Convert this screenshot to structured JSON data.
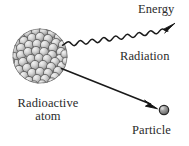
{
  "diagram": {
    "title_caption": "",
    "background_color": "#ffffff",
    "labels": {
      "energy": "Energy",
      "radiation": "Radiation",
      "particle": "Particle",
      "radioactive_atom_line1": "Radioactive",
      "radioactive_atom_line2": "atom"
    },
    "elements": {
      "nucleus": {
        "name": "radioactive-atom-nucleus",
        "shape": "cluster-of-spheres",
        "center_x": 40,
        "center_y": 56,
        "radius": 27,
        "sphere_fill": "#c9c9c9",
        "sphere_stroke": "#4a4a4a",
        "highlight": "#ebebeb",
        "sphere_count": 61
      },
      "radiation_wave": {
        "name": "radiation-wave-arrow",
        "shape": "sinusoidal-arrow",
        "start_x": 62,
        "start_y": 45,
        "end_x": 170,
        "end_y": 25,
        "amplitude": 3.4,
        "wavelength": 15,
        "stroke": "#1a1a1a"
      },
      "particle_arrow": {
        "name": "particle-straight-arrow",
        "shape": "straight-arrow",
        "start_x": 62,
        "start_y": 69,
        "end_x": 156,
        "end_y": 107,
        "stroke": "#1a1a1a"
      },
      "particle_sphere": {
        "name": "emitted-particle-sphere",
        "shape": "sphere",
        "center_x": 164,
        "center_y": 110,
        "radius": 4.6,
        "fill": "#8f8f8f",
        "stroke": "#2a2a2a",
        "highlight": "#c8c8c8"
      }
    },
    "colors": {
      "ink": "#1a1a1a",
      "text": "#2b2b2b",
      "sphere_light": "#ebebeb",
      "sphere_mid": "#c9c9c9",
      "sphere_dark": "#4a4a4a"
    }
  }
}
